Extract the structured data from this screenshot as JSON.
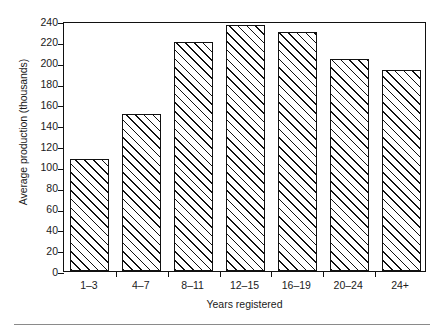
{
  "chart_data": {
    "type": "bar",
    "title": "",
    "subtitle": "",
    "xlabel": "Years registered",
    "ylabel": "Average production (thousands)",
    "categories": [
      "1–3",
      "4–7",
      "8–11",
      "12–15",
      "16–19",
      "20–24",
      "24+"
    ],
    "values": [
      108,
      151,
      220,
      236,
      229,
      204,
      193
    ],
    "series": [
      {
        "name": "Average production",
        "values": [
          108,
          151,
          220,
          236,
          229,
          204,
          193
        ]
      }
    ],
    "ylim": [
      0,
      240
    ],
    "ytick_values": [
      0,
      20,
      40,
      60,
      80,
      100,
      120,
      140,
      160,
      180,
      200,
      220,
      240
    ],
    "ytick_labels": [
      "0",
      "20",
      "40",
      "60",
      "80",
      "100",
      "120",
      "140",
      "160",
      "180",
      "200",
      "220",
      "240"
    ],
    "grid": false,
    "legend": null,
    "legend_position": "none",
    "annotations": [],
    "bar_fill": "hatched-diagonal",
    "colors": {
      "line": "#111111",
      "fill": "#ffffff",
      "hatch": "#111111",
      "text": "#1a1a1a",
      "rule": "#8a8a8a"
    }
  }
}
